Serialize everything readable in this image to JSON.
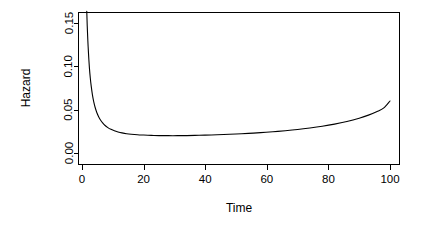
{
  "chart_data": {
    "type": "line",
    "title": "",
    "xlabel": "Time",
    "ylabel": "Hazard",
    "xlim": [
      0,
      103
    ],
    "ylim": [
      0.0,
      0.1635
    ],
    "grid": false,
    "legend": null,
    "xticks": [
      0,
      20,
      40,
      60,
      80,
      100
    ],
    "xticklabels": [
      "0",
      "20",
      "40",
      "60",
      "80",
      "100"
    ],
    "yticks": [
      0.0,
      0.05,
      0.1,
      0.15
    ],
    "yticklabels": [
      "0.00",
      "0.05",
      "0.10",
      "0.15"
    ],
    "series": [
      {
        "name": "hazard",
        "note": "bathtub-shaped hazard, clipped at top of panel near t=2",
        "x": [
          1.55,
          1.7,
          1.9,
          2.1,
          2.4,
          2.7,
          3.0,
          3.4,
          3.8,
          4.3,
          4.8,
          5.4,
          6.0,
          6.7,
          7.5,
          8.4,
          9.4,
          10.5,
          11.7,
          13.0,
          14.5,
          16.0,
          18.0,
          20.0,
          22.5,
          25.0,
          28.0,
          31.0,
          34.0,
          38.0,
          42.0,
          46.0,
          50.0,
          54.0,
          58.0,
          62.0,
          66.0,
          70.0,
          74.0,
          78.0,
          82.0,
          86.0,
          90.0,
          93.0,
          96.0,
          98.0,
          100.0
        ],
        "y": [
          0.1635,
          0.1465,
          0.1295,
          0.1155,
          0.0985,
          0.0862,
          0.0768,
          0.0668,
          0.0594,
          0.0522,
          0.0468,
          0.0419,
          0.0381,
          0.0347,
          0.0317,
          0.0293,
          0.0273,
          0.0256,
          0.0243,
          0.0232,
          0.0223,
          0.0217,
          0.0211,
          0.0207,
          0.0203,
          0.0201,
          0.02,
          0.02,
          0.0201,
          0.0204,
          0.0208,
          0.0213,
          0.0219,
          0.0226,
          0.0235,
          0.0245,
          0.0257,
          0.0271,
          0.0288,
          0.0308,
          0.0333,
          0.0364,
          0.0402,
          0.0437,
          0.0482,
          0.052,
          0.06
        ]
      }
    ]
  },
  "axis": {
    "x_title": "Time",
    "y_title": "Hazard"
  }
}
